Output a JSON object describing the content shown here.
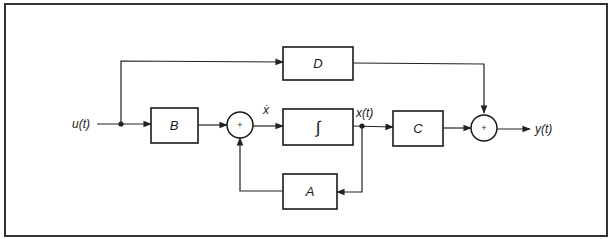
{
  "diagram": {
    "input_label": "u(t)",
    "output_label": "y(t)",
    "state_label": "x(t)",
    "state_derivative_label": "ẋ",
    "blocks": {
      "B": "B",
      "D": "D",
      "integrator": "∫",
      "C": "C",
      "A": "A"
    },
    "summing_junctions": {
      "sum1": "+",
      "sum2": "+"
    },
    "colors": {
      "line": "#222222",
      "background": "#ffffff",
      "frame": "#333333"
    }
  }
}
